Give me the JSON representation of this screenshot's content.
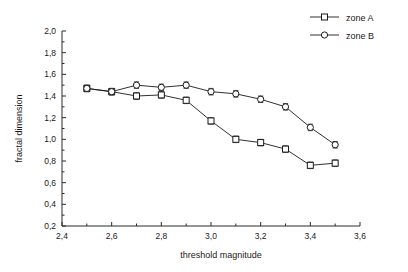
{
  "chart_data": {
    "type": "line",
    "title": "",
    "subtitle": "",
    "xlabel": "threshold magnitude",
    "ylabel": "fractal dimension",
    "xlim": [
      2.4,
      3.6
    ],
    "ylim": [
      0.2,
      2.0
    ],
    "xticks": [
      "2,4",
      "2,6",
      "2,8",
      "3,0",
      "3,2",
      "3,4",
      "3,6"
    ],
    "xtick_values": [
      2.4,
      2.6,
      2.8,
      3.0,
      3.2,
      3.4,
      3.6
    ],
    "yticks": [
      "0,2",
      "0,4",
      "0,6",
      "0,8",
      "1,0",
      "1,2",
      "1,4",
      "1,6",
      "1,8",
      "2,0"
    ],
    "ytick_values": [
      0.2,
      0.4,
      0.6,
      0.8,
      1.0,
      1.2,
      1.4,
      1.6,
      1.8,
      2.0
    ],
    "grid": false,
    "legend_position": "top-right",
    "x": [
      2.5,
      2.6,
      2.7,
      2.8,
      2.9,
      3.0,
      3.1,
      3.2,
      3.3,
      3.4,
      3.5
    ],
    "series": [
      {
        "name": "zone A",
        "marker": "square",
        "color": "#1a1a1a",
        "values": [
          1.47,
          1.44,
          1.4,
          1.41,
          1.36,
          1.17,
          1.0,
          0.97,
          0.91,
          0.76,
          0.78
        ],
        "errors": [
          0.03,
          0.03,
          0.03,
          0.03,
          0.03,
          0.03,
          0.03,
          0.03,
          0.03,
          0.03,
          0.03
        ]
      },
      {
        "name": "zone B",
        "marker": "circle",
        "color": "#1a1a1a",
        "values": [
          1.47,
          1.44,
          1.5,
          1.48,
          1.5,
          1.44,
          1.42,
          1.37,
          1.3,
          1.11,
          0.95
        ],
        "errors": [
          0.03,
          0.03,
          0.03,
          0.03,
          0.03,
          0.03,
          0.03,
          0.03,
          0.03,
          0.03,
          0.03
        ]
      }
    ]
  },
  "legend": {
    "items": [
      {
        "label": "zone A",
        "marker": "square"
      },
      {
        "label": "zone B",
        "marker": "circle"
      }
    ]
  },
  "axes": {
    "x_title": "threshold magnitude",
    "y_title": "fractal dimension"
  }
}
